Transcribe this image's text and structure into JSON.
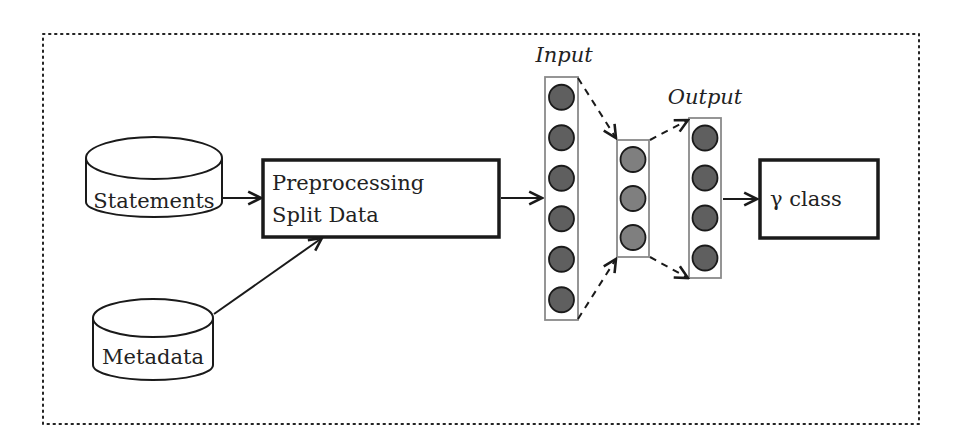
{
  "diagram": {
    "nodes": {
      "statements": {
        "label": "Statements",
        "shape": "cylinder"
      },
      "metadata": {
        "label": "Metadata",
        "shape": "cylinder"
      },
      "preprocessing": {
        "line1": "Preprocessing",
        "line2": "Split Data",
        "shape": "box"
      },
      "gamma_class": {
        "label": "γ class",
        "shape": "box"
      }
    },
    "network": {
      "input_label": "Input",
      "output_label": "Output",
      "layers": [
        {
          "name": "input",
          "neurons": 6
        },
        {
          "name": "hidden",
          "neurons": 3
        },
        {
          "name": "output",
          "neurons": 4
        }
      ]
    },
    "edges": [
      {
        "from": "statements",
        "to": "preprocessing",
        "style": "solid"
      },
      {
        "from": "metadata",
        "to": "preprocessing",
        "style": "solid"
      },
      {
        "from": "preprocessing",
        "to": "input",
        "style": "solid"
      },
      {
        "from": "input",
        "to": "hidden",
        "style": "dashed"
      },
      {
        "from": "hidden",
        "to": "output",
        "style": "dashed"
      },
      {
        "from": "output",
        "to": "gamma_class",
        "style": "solid"
      }
    ],
    "colors": {
      "stroke": "#1a1a1a",
      "input_neuron": "#5f5f5f",
      "hidden_neuron": "#7f7f7f",
      "output_neuron": "#5f5f5f",
      "layer_box": "#8a8a8a"
    }
  }
}
